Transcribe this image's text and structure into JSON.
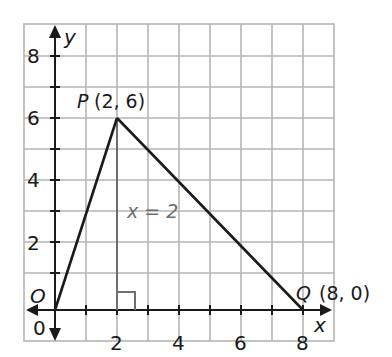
{
  "figure": {
    "axes": {
      "x_label": "x",
      "y_label": "y",
      "origin_label": "O",
      "origin_tick": "0",
      "x_ticks": [
        "2",
        "4",
        "6",
        "8"
      ],
      "y_ticks": [
        "2",
        "4",
        "6",
        "8"
      ]
    },
    "points": {
      "P": {
        "name": "P",
        "coords": "(2, 6)",
        "x": 2,
        "y": 6
      },
      "Q": {
        "name": "Q",
        "coords": "(8, 0)",
        "x": 8,
        "y": 0
      },
      "O": {
        "name": "O",
        "x": 0,
        "y": 0
      }
    },
    "altitude_label": "x = 2",
    "colors": {
      "grid": "#b5b5b5",
      "line": "#1a1a1a",
      "altitude": "#6e6e6e"
    }
  }
}
